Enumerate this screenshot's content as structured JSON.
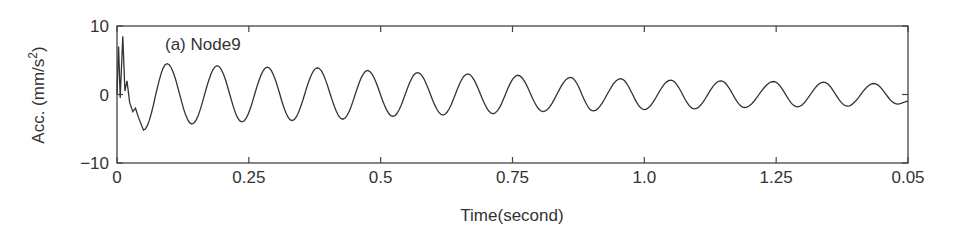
{
  "chart_data": {
    "type": "line",
    "title": "(a) Node9",
    "xlabel": "Time(second)",
    "ylabel": "Acc. (mm/s²)",
    "ylabel_parts": {
      "main": "Acc. (mm/s",
      "sup": "2",
      "end": ")"
    },
    "xlim": [
      0,
      1.5
    ],
    "ylim": [
      -10,
      10
    ],
    "x_ticks": [
      0,
      0.25,
      0.5,
      0.75,
      1.0,
      1.25,
      1.5
    ],
    "x_tick_labels": [
      "0",
      "0.25",
      "0.5",
      "0.75",
      "1.0",
      "1.25",
      "0.05"
    ],
    "y_ticks": [
      -10,
      0,
      10
    ],
    "y_tick_labels": [
      "−10",
      "0",
      "10"
    ],
    "grid": false,
    "legend": null,
    "series": [
      {
        "name": "Node9 acceleration",
        "description": "Initial high-frequency transient then decaying sinusoid",
        "transient_points": [
          [
            0,
            0
          ],
          [
            0.003,
            7
          ],
          [
            0.006,
            -0.5
          ],
          [
            0.011,
            8.5
          ],
          [
            0.015,
            0.5
          ],
          [
            0.019,
            2
          ],
          [
            0.024,
            -1.2
          ],
          [
            0.03,
            -2.5
          ],
          [
            0.035,
            -2
          ],
          [
            0.04,
            -3.2
          ],
          [
            0.05,
            -5.2
          ]
        ],
        "peaks": [
          [
            0.095,
            4.5
          ],
          [
            0.19,
            4.2
          ],
          [
            0.285,
            4.0
          ],
          [
            0.38,
            3.9
          ],
          [
            0.475,
            3.5
          ],
          [
            0.57,
            3.2
          ],
          [
            0.665,
            3.0
          ],
          [
            0.76,
            2.8
          ],
          [
            0.86,
            2.5
          ],
          [
            0.955,
            2.3
          ],
          [
            1.05,
            2.1
          ],
          [
            1.145,
            2.0
          ],
          [
            1.245,
            1.9
          ],
          [
            1.34,
            1.8
          ],
          [
            1.435,
            1.6
          ]
        ],
        "troughs": [
          [
            0.05,
            -5.2
          ],
          [
            0.142,
            -4.3
          ],
          [
            0.237,
            -4.0
          ],
          [
            0.332,
            -3.8
          ],
          [
            0.428,
            -3.6
          ],
          [
            0.523,
            -3.2
          ],
          [
            0.618,
            -3.0
          ],
          [
            0.713,
            -2.8
          ],
          [
            0.808,
            -2.5
          ],
          [
            0.903,
            -2.4
          ],
          [
            1.0,
            -2.2
          ],
          [
            1.095,
            -2.1
          ],
          [
            1.19,
            -1.9
          ],
          [
            1.29,
            -1.8
          ],
          [
            1.385,
            -1.7
          ],
          [
            1.48,
            -1.4
          ]
        ],
        "end_value": -1.0,
        "color": "#333333"
      }
    ]
  }
}
